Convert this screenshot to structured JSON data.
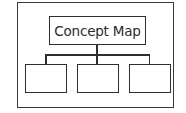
{
  "diagram": {
    "type": "hierarchy",
    "root": {
      "label": "Concept Map"
    },
    "children": [
      {
        "label": ""
      },
      {
        "label": ""
      },
      {
        "label": ""
      }
    ],
    "colors": {
      "stroke": "#2e2e2e",
      "background": "#ffffff",
      "text": "#2a2a2a"
    }
  }
}
